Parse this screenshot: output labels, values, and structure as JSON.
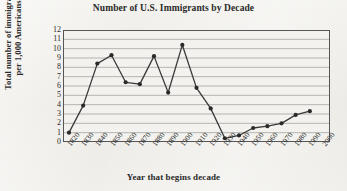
{
  "chart_data": {
    "type": "line",
    "title": "Number of U.S. Immigrants by Decade",
    "xlabel": "Year that begins decade",
    "ylabel": "Total number of immigrants per 1,000 Americans",
    "ylabel_line1": "Total number of immigrants",
    "ylabel_line2": "per 1,000 Americans",
    "grid": true,
    "legend": "none",
    "ylim": [
      0,
      12
    ],
    "yticks": [
      0,
      1,
      2,
      3,
      4,
      5,
      6,
      7,
      8,
      9,
      10,
      11,
      12
    ],
    "xticks": [
      "1820",
      "1830",
      "1840",
      "1850",
      "1860",
      "1870",
      "1880",
      "1890",
      "1900",
      "1910",
      "1920",
      "1930",
      "1940",
      "1950",
      "1960",
      "1970",
      "1980",
      "1990",
      "2000"
    ],
    "categories": [
      "1820",
      "1830",
      "1840",
      "1850",
      "1860",
      "1870",
      "1880",
      "1890",
      "1900",
      "1910",
      "1920",
      "1930",
      "1940",
      "1950",
      "1960",
      "1970",
      "1980",
      "1990"
    ],
    "values": [
      1.0,
      3.9,
      8.4,
      9.3,
      6.4,
      6.2,
      9.2,
      5.3,
      10.4,
      5.8,
      3.6,
      0.4,
      0.7,
      1.5,
      1.7,
      2.0,
      2.9,
      3.3
    ],
    "marker_color": "#2a2a2a",
    "line_color": "#3a3a3a",
    "grid_color": "#9a9a9a",
    "axis_color": "#555555",
    "plot_background": "#f3f2ee"
  }
}
